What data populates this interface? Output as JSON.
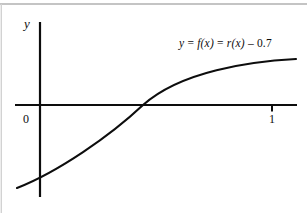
{
  "figure": {
    "background_color": "#ffffff",
    "ink_color": "#0d0d0d",
    "border_color": "#b4b4b4",
    "width": 307,
    "height": 213
  },
  "labels": {
    "y_axis": "y",
    "origin": "0",
    "x_tick_one": "1",
    "equation": "y = f(x) = r(x) – 0.7",
    "equation_parts": {
      "y": "y",
      "eq1": " = ",
      "f_of_x": "f(x)",
      "eq2": " = ",
      "r_of_x": "r(x)",
      "minus": " – ",
      "constant": "0.7"
    }
  },
  "chart_data": {
    "type": "line",
    "title": "",
    "subtitle": "",
    "xlabel": "",
    "ylabel": "y",
    "grid": false,
    "legend": null,
    "annotations": [
      {
        "text": "y = f(x) = r(x) – 0.7",
        "x": 0.62,
        "y": 0.62,
        "role": "curve-equation"
      }
    ],
    "axes": {
      "x_axis_visible": true,
      "y_axis_visible": true,
      "x_ticks": [
        0,
        1
      ],
      "x_tick_labels": [
        "0",
        "1"
      ],
      "y_ticks": [],
      "y_tick_labels": [],
      "xlim": [
        -0.11,
        1.11
      ],
      "ylim": [
        -0.43,
        0.39
      ]
    },
    "series": [
      {
        "name": "y = f(x) = r(x) - 0.7",
        "x": [
          -0.1,
          0.0,
          0.1,
          0.2,
          0.3,
          0.4,
          0.44,
          0.5,
          0.6,
          0.7,
          0.8,
          0.9,
          1.0,
          1.1
        ],
        "y": [
          -0.38,
          -0.31,
          -0.25,
          -0.19,
          -0.13,
          -0.07,
          -0.05,
          0.0,
          0.06,
          0.11,
          0.16,
          0.2,
          0.24,
          0.27
        ],
        "x_root": 0.44,
        "y_intercept": -0.31,
        "shape": "increasing-concave-down"
      }
    ]
  },
  "geometry": {
    "x_axis_y_px": 105,
    "y_axis_x_px": 40,
    "x_axis_start_px": 15,
    "x_axis_end_px": 297,
    "y_axis_top_px": 22,
    "y_axis_bottom_px": 197,
    "tick_one_x_px": 272,
    "curve_path": "M 17,188 C 60,171 108,135 143,105 C 180,75 250,62 295,59",
    "tick_one_path": "M 272,105 L 272,111"
  }
}
